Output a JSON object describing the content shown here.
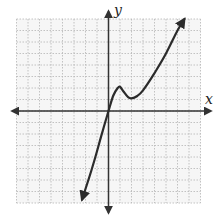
{
  "chart_data": {
    "type": "line",
    "title": "",
    "xlabel": "x",
    "ylabel": "y",
    "grid": true,
    "xlim": [
      -8,
      8
    ],
    "ylim": [
      -8,
      8
    ],
    "tick_labels": false,
    "series": [
      {
        "name": "f(x)",
        "description": "cubic-like curve through origin with local max near (1,2) and local min near (2,1.1), arrows at both ends",
        "x": [
          -2.3,
          -1.5,
          -1,
          -0.5,
          0,
          0.4,
          0.8,
          1.0,
          1.3,
          1.7,
          2.0,
          2.5,
          3,
          4,
          5,
          6,
          6.6
        ],
        "y": [
          -7.7,
          -5.2,
          -3.5,
          -1.7,
          0,
          1.3,
          2.0,
          2.1,
          1.7,
          1.2,
          1.1,
          1.3,
          1.8,
          3.3,
          5.0,
          7.0,
          8.0
        ]
      }
    ],
    "key_points": {
      "origin_crossing": [
        0,
        0
      ],
      "local_max": [
        1,
        2
      ],
      "local_min": [
        2,
        1.1
      ]
    },
    "colors": {
      "curve": "#2b2b2b",
      "axes": "#333333",
      "grid": "#b5b5b5"
    }
  },
  "labels": {
    "x_axis": "x",
    "y_axis": "y"
  }
}
